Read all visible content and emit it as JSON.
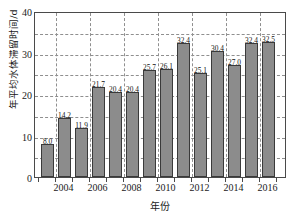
{
  "chart_data": {
    "type": "bar",
    "title": "",
    "xlabel": "年份",
    "ylabel": "年平均水体滞留时间/d",
    "categories": [
      "2003",
      "2004",
      "2005",
      "2006",
      "2007",
      "2008",
      "2009",
      "2010",
      "2011",
      "2012",
      "2013",
      "2014",
      "2015",
      "2016"
    ],
    "values": [
      8.0,
      14.2,
      11.9,
      21.7,
      20.4,
      20.4,
      25.7,
      26.1,
      32.4,
      25.1,
      30.4,
      27.0,
      32.4,
      32.5
    ],
    "value_labels": [
      "8.0",
      "14.2",
      "11.9",
      "21.7",
      "20.4",
      "20.4",
      "25.7",
      "26.1",
      "32.4",
      "25.1",
      "30.4",
      "27.0",
      "32.4",
      "32.5"
    ],
    "ylim": [
      0,
      40
    ],
    "y_ticks": [
      0,
      10,
      20,
      30,
      40
    ],
    "y_tick_labels": [
      "0",
      "10",
      "20",
      "30",
      "40"
    ],
    "y_gridlines": [
      5,
      10,
      15,
      20,
      25,
      30,
      35
    ],
    "x_tick_labels": [
      "2004",
      "2006",
      "2008",
      "2010",
      "2012",
      "2014",
      "2016"
    ],
    "x_gridline_years": [
      "2004",
      "2006",
      "2008",
      "2010",
      "2012",
      "2014",
      "2016"
    ],
    "grid": true,
    "legend": "none",
    "bar_color": "#8c8c8c",
    "bar_edge_color": "#3a3a3a",
    "grid_color": "#8f8f8f",
    "axis_color": "#4a4a4a",
    "text_color": "#1a1a1a"
  }
}
